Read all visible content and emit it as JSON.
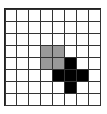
{
  "grid": {
    "rows": 8,
    "cols": 8,
    "colors": {
      "empty": "#ffffff",
      "gray": "#9a9a9a",
      "black": "#000000",
      "line": "#333333"
    },
    "gray_cells": [
      [
        3,
        3
      ],
      [
        3,
        4
      ],
      [
        4,
        3
      ],
      [
        4,
        4
      ]
    ],
    "black_cells": [
      [
        4,
        5
      ],
      [
        5,
        4
      ],
      [
        5,
        5
      ],
      [
        5,
        6
      ],
      [
        6,
        5
      ]
    ]
  }
}
